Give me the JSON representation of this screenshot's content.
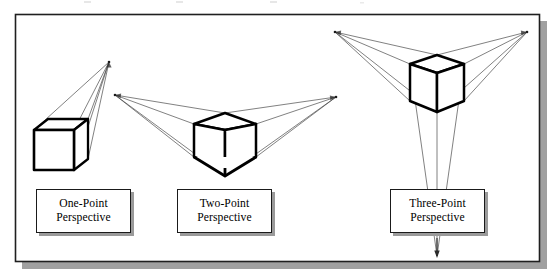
{
  "figure": {
    "frame": {
      "border_color": "#1f1f1f",
      "shadow_color": "#9a9a9a",
      "background_color": "#ffffff",
      "x": 15,
      "y": 14,
      "width": 525,
      "height": 248
    },
    "stroke_colors": {
      "cube_edge": "#000000",
      "construction_line": "#3b3b3b",
      "vanishing_arrow": "#2b2b2b"
    },
    "panels": [
      {
        "id": "one-point",
        "caption_line1": "One-Point",
        "caption_line2": "Perspective",
        "caption_box": {
          "x": 36,
          "y": 189,
          "width": 95,
          "height": 44
        },
        "vanishing_points": [
          {
            "name": "vp-center",
            "x": 109,
            "y": 62
          }
        ],
        "cube": {
          "front_face": [
            [
              34,
              130
            ],
            [
              74,
              130
            ],
            [
              74,
              170
            ],
            [
              34,
              170
            ]
          ],
          "top_back_left": [
            48,
            119
          ],
          "top_back_right": [
            88,
            119
          ],
          "right_back_bottom": [
            88,
            159
          ]
        }
      },
      {
        "id": "two-point",
        "caption_line1": "Two-Point",
        "caption_line2": "Perspective",
        "caption_box": {
          "x": 177,
          "y": 189,
          "width": 95,
          "height": 44
        },
        "vanishing_points": [
          {
            "name": "vp-left",
            "x": 115,
            "y": 95
          },
          {
            "name": "vp-right",
            "x": 336,
            "y": 97
          }
        ],
        "cube": {
          "front_vertical_top": [
            225,
            130
          ],
          "front_vertical_bottom": [
            225,
            168
          ],
          "left_top": [
            194,
            124
          ],
          "left_bottom": [
            194,
            157
          ],
          "right_top": [
            256,
            124
          ],
          "right_bottom": [
            256,
            157
          ],
          "top_back": [
            225,
            113
          ],
          "bottom_front": [
            225,
            176
          ]
        }
      },
      {
        "id": "three-point",
        "caption_line1": "Three-Point",
        "caption_line2": "Perspective",
        "caption_box": {
          "x": 390,
          "y": 189,
          "width": 95,
          "height": 44
        },
        "vanishing_points": [
          {
            "name": "vp-upper-left",
            "x": 335,
            "y": 32
          },
          {
            "name": "vp-upper-right",
            "x": 527,
            "y": 32
          },
          {
            "name": "vp-bottom",
            "x": 437,
            "y": 258
          }
        ],
        "cube": {
          "front_vertical_top": [
            437,
            73
          ],
          "front_vertical_bottom": [
            437,
            112
          ],
          "left_top": [
            410,
            64
          ],
          "left_bottom": [
            410,
            101
          ],
          "right_top": [
            464,
            64
          ],
          "right_bottom": [
            464,
            101
          ],
          "top_back": [
            437,
            55
          ]
        }
      }
    ]
  }
}
